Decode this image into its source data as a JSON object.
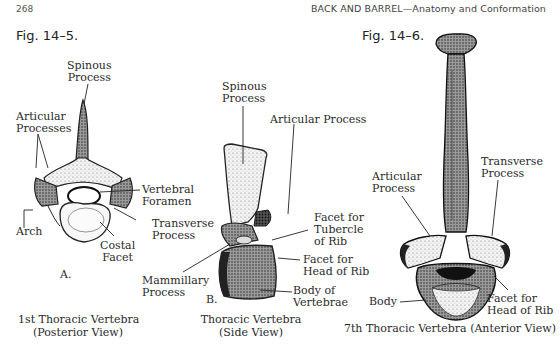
{
  "header": {
    "page_number": "268",
    "running_title": "BACK AND BARREL—Anatomy and Conformation"
  },
  "figures": [
    {
      "label": "Fig. 14–5.",
      "panels": [
        {
          "letter": "A.",
          "caption_line1": "1st Thoracic Vertebra",
          "caption_line2": "(Posterior View)",
          "annotations": [
            {
              "line1": "Spinous",
              "line2": "Process"
            },
            {
              "line1": "Articular",
              "line2": "Processes"
            },
            {
              "line1": "Vertebral",
              "line2": "Foramen"
            },
            {
              "line1": "Arch",
              "line2": ""
            },
            {
              "line1": "Transverse",
              "line2": "Process"
            },
            {
              "line1": "Costal",
              "line2": "Facet"
            }
          ]
        },
        {
          "letter": "B.",
          "caption_line1": "Thoracic Vertebra",
          "caption_line2": "(Side View)",
          "annotations": [
            {
              "line1": "Spinous",
              "line2": "Process"
            },
            {
              "line1": "Articular Process",
              "line2": ""
            },
            {
              "line1": "Facet for",
              "line2": "Tubercle",
              "line3": "of Rib"
            },
            {
              "line1": "Facet for",
              "line2": "Head of Rib"
            },
            {
              "line1": "Mammillary",
              "line2": "Process"
            },
            {
              "line1": "Body of",
              "line2": "Vertebrae"
            }
          ]
        }
      ]
    },
    {
      "label": "Fig. 14–6.",
      "panels": [
        {
          "caption_line1": "7th Thoracic Vertebra (Anterior View)",
          "annotations": [
            {
              "line1": "Articular",
              "line2": "Process"
            },
            {
              "line1": "Transverse",
              "line2": "Process"
            },
            {
              "line1": "Body",
              "line2": ""
            },
            {
              "line1": "Facet for",
              "line2": "Head of Rib"
            }
          ]
        }
      ]
    }
  ]
}
